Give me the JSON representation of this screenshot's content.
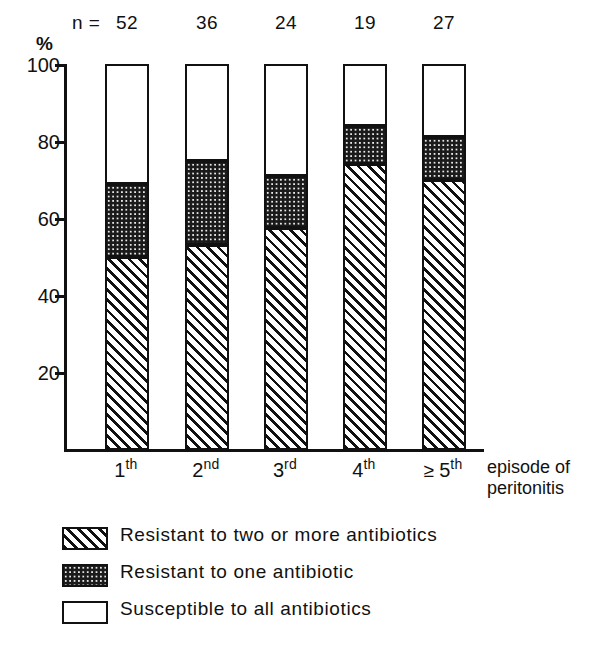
{
  "chart_data": {
    "type": "bar",
    "title": "",
    "subtitle": "",
    "stacked": true,
    "normalized_percent": true,
    "xlabel": "episode of peritonitis",
    "ylabel": "%",
    "ylim": [
      0,
      100
    ],
    "yticks": [
      20,
      40,
      60,
      80,
      100
    ],
    "ytick_labels": [
      "20",
      "40",
      "60",
      "80",
      "100"
    ],
    "grid": false,
    "legend_position": "below-axes",
    "categories": [
      "1th",
      "2nd",
      "3rd",
      "4th",
      "≥ 5th"
    ],
    "category_parts": [
      {
        "num": "1",
        "sup": "th",
        "prefix": ""
      },
      {
        "num": "2",
        "sup": "nd",
        "prefix": ""
      },
      {
        "num": "3",
        "sup": "rd",
        "prefix": ""
      },
      {
        "num": "4",
        "sup": "th",
        "prefix": ""
      },
      {
        "num": "5",
        "sup": "th",
        "prefix": "≥ "
      }
    ],
    "n_label": "n =",
    "n_values": [
      52,
      36,
      24,
      19,
      27
    ],
    "series": [
      {
        "name": "Resistant to two or more antibiotics",
        "pattern": "diagonal-hatch",
        "values": [
          50,
          53,
          57.5,
          74,
          70
        ]
      },
      {
        "name": "Resistant to one antibiotic",
        "pattern": "dark-stipple",
        "values": [
          19,
          22,
          13.5,
          10,
          11
        ]
      },
      {
        "name": "Susceptible to all antibiotics",
        "pattern": "open-white",
        "values": [
          31,
          25,
          29,
          16,
          19
        ]
      }
    ],
    "cumulative_tops": [
      {
        "hatch_top": 50,
        "dots_top": 69
      },
      {
        "hatch_top": 53,
        "dots_top": 75
      },
      {
        "hatch_top": 57.5,
        "dots_top": 71
      },
      {
        "hatch_top": 74,
        "dots_top": 84
      },
      {
        "hatch_top": 70,
        "dots_top": 81
      }
    ],
    "colors": {
      "ink": "#111111",
      "background": "#ffffff",
      "stipple_fill": "#1a1a1a"
    }
  },
  "axis": {
    "percent_symbol": "%",
    "caption_line1": "episode of",
    "caption_line2": "peritonitis"
  },
  "legend": {
    "items": [
      {
        "label": "Resistant to two or more antibiotics",
        "pattern": "diagonal-hatch"
      },
      {
        "label": "Resistant to one antibiotic",
        "pattern": "dark-stipple"
      },
      {
        "label": "Susceptible to all antibiotics",
        "pattern": "open-white"
      }
    ]
  }
}
